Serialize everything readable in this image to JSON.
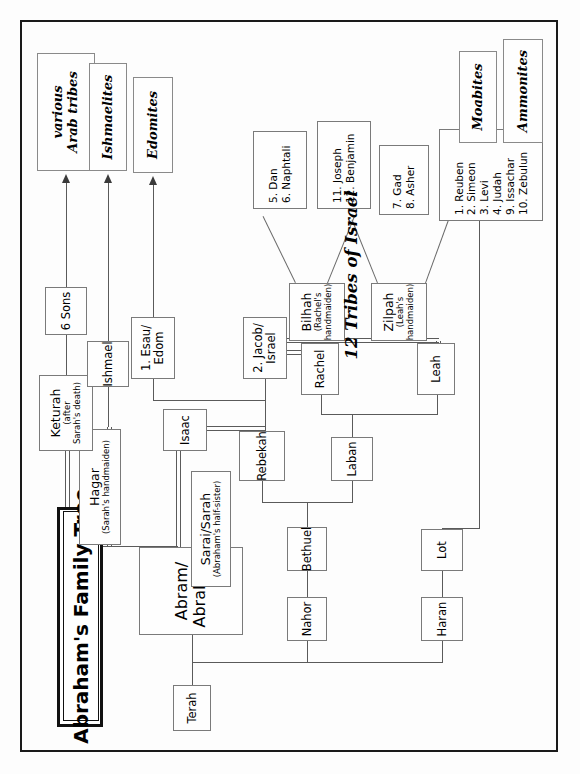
{
  "title": {
    "text": "Abraham's Family Tree"
  },
  "caption": {
    "tribes": "12 Tribes of Israel"
  },
  "nodes": {
    "terah": {
      "name": "Terah"
    },
    "nahor": {
      "name": "Nahor"
    },
    "haran": {
      "name": "Haran"
    },
    "lot": {
      "name": "Lot"
    },
    "bethuel": {
      "name": "Bethuel"
    },
    "laban": {
      "name": "Laban"
    },
    "rebekah": {
      "name": "Rebekah"
    },
    "abraham": {
      "name": "Abram/ Abraham",
      "line1": "Abram/",
      "line2": "Abraham"
    },
    "sarah": {
      "name": "Sarai/Sarah",
      "sub": "(Abraham's half-sister)"
    },
    "hagar": {
      "name": "Hagar",
      "sub": "(Sarah's handmaiden)"
    },
    "keturah": {
      "name": "Keturah",
      "sub1": "(after",
      "sub2": "Sarah's death)"
    },
    "ishmael": {
      "name": "Ishmael"
    },
    "sixsons": {
      "name": "6 Sons"
    },
    "isaac": {
      "name": "Isaac"
    },
    "esau": {
      "line1": "1. Esau/",
      "line2": "Edom"
    },
    "jacob": {
      "line1": "2. Jacob/",
      "line2": "Israel"
    },
    "rachel": {
      "name": "Rachel"
    },
    "leah": {
      "name": "Leah"
    },
    "bilhah": {
      "name": "Bilhah",
      "sub1": "(Rachel's",
      "sub2": "handmaiden)"
    },
    "zilpah": {
      "name": "Zilpah",
      "sub1": "(Leah's",
      "sub2": "handmaiden)"
    }
  },
  "tribes": {
    "leah_group": [
      "1. Reuben",
      "2. Simeon",
      "3. Levi",
      "4. Judah",
      "9. Issachar",
      "10. Zebulun"
    ],
    "zilpah_group": [
      "7. Gad",
      "8. Asher"
    ],
    "rachel_group": [
      "11. Joseph",
      "12. Benjamin"
    ],
    "bilhah_group": [
      "5. Dan",
      "6. Naphtali"
    ]
  },
  "terminals": {
    "arab_tribes": {
      "line1": "various",
      "line2": "Arab tribes"
    },
    "ishmaelites": {
      "line1": "Ishmaelites"
    },
    "edomites": {
      "line1": "Edomites"
    },
    "moabites": {
      "line1": "Moabites"
    },
    "ammonites": {
      "line1": "Ammonites"
    }
  },
  "colors": {
    "page_border": "#1a1a1a",
    "node_border": "#7a7a7a",
    "line": "#5a5a5a",
    "background": "#fdfdfd"
  }
}
